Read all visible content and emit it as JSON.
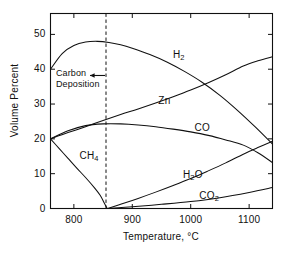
{
  "chart_data": {
    "type": "line",
    "title": "",
    "xlabel": "Temperature, °C",
    "ylabel": "Volume Percent",
    "xlim": [
      760,
      1140
    ],
    "ylim": [
      0,
      56
    ],
    "xticks": [
      800,
      900,
      1000,
      1100
    ],
    "yticks": [
      0,
      10,
      20,
      30,
      40,
      50
    ],
    "grid": false,
    "legend": "inline curve labels",
    "annotations": [
      {
        "text": "Carbon Deposition",
        "line1": "Carbon",
        "line2": "Deposition",
        "arrow": "left-arrow-to-dashed-line",
        "x": 855,
        "y": 38
      }
    ],
    "vertical_reference_line": {
      "x": 855,
      "style": "dashed",
      "label": "carbon deposition boundary"
    },
    "series": [
      {
        "name": "H2",
        "label": "H₂",
        "label_x": 985,
        "label_y": 44,
        "points": [
          [
            760,
            40.0
          ],
          [
            780,
            44.5
          ],
          [
            800,
            46.8
          ],
          [
            820,
            47.8
          ],
          [
            840,
            48.0
          ],
          [
            860,
            47.7
          ],
          [
            880,
            47.0
          ],
          [
            900,
            46.0
          ],
          [
            930,
            44.2
          ],
          [
            960,
            42.0
          ],
          [
            990,
            39.3
          ],
          [
            1020,
            36.2
          ],
          [
            1050,
            32.5
          ],
          [
            1080,
            28.2
          ],
          [
            1110,
            23.5
          ],
          [
            1140,
            18.5
          ]
        ]
      },
      {
        "name": "Zn",
        "label": "Zn",
        "label_x": 960,
        "label_y": 31,
        "points": [
          [
            760,
            20.0
          ],
          [
            790,
            21.8
          ],
          [
            820,
            23.5
          ],
          [
            850,
            25.3
          ],
          [
            880,
            27.0
          ],
          [
            910,
            28.6
          ],
          [
            940,
            30.3
          ],
          [
            970,
            32.1
          ],
          [
            1000,
            34.0
          ],
          [
            1030,
            36.1
          ],
          [
            1060,
            38.4
          ],
          [
            1090,
            40.9
          ],
          [
            1115,
            42.4
          ],
          [
            1140,
            43.6
          ]
        ]
      },
      {
        "name": "CO",
        "label": "CO",
        "label_x": 1022,
        "label_y": 23,
        "points": [
          [
            760,
            20.0
          ],
          [
            790,
            22.3
          ],
          [
            820,
            23.8
          ],
          [
            850,
            24.3
          ],
          [
            880,
            24.3
          ],
          [
            910,
            24.0
          ],
          [
            940,
            23.5
          ],
          [
            970,
            22.8
          ],
          [
            1000,
            22.0
          ],
          [
            1030,
            21.0
          ],
          [
            1060,
            19.7
          ],
          [
            1090,
            18.2
          ],
          [
            1115,
            16.0
          ],
          [
            1140,
            13.2
          ]
        ]
      },
      {
        "name": "CH4",
        "label": "CH₄",
        "label_x": 825,
        "label_y": 15,
        "points": [
          [
            760,
            20.0
          ],
          [
            775,
            17.2
          ],
          [
            790,
            14.4
          ],
          [
            805,
            11.6
          ],
          [
            820,
            8.9
          ],
          [
            835,
            6.0
          ],
          [
            845,
            3.8
          ],
          [
            852,
            1.6
          ],
          [
            856,
            0.3
          ],
          [
            858,
            0.0
          ]
        ]
      },
      {
        "name": "H2O",
        "label": "H₂O",
        "label_x": 1002,
        "label_y": 9.6,
        "points": [
          [
            858,
            0.0
          ],
          [
            880,
            1.2
          ],
          [
            910,
            2.9
          ],
          [
            940,
            4.7
          ],
          [
            970,
            6.6
          ],
          [
            1000,
            8.6
          ],
          [
            1030,
            10.8
          ],
          [
            1060,
            13.1
          ],
          [
            1090,
            15.6
          ],
          [
            1115,
            17.5
          ],
          [
            1140,
            19.3
          ]
        ]
      },
      {
        "name": "CO2",
        "label": "CO₂",
        "label_x": 1030,
        "label_y": 3.5,
        "points": [
          [
            858,
            0.0
          ],
          [
            900,
            0.5
          ],
          [
            950,
            1.2
          ],
          [
            1000,
            2.0
          ],
          [
            1050,
            3.1
          ],
          [
            1100,
            4.6
          ],
          [
            1140,
            6.0
          ]
        ]
      }
    ]
  },
  "axes": {
    "y_tick_labels": [
      "50",
      "40",
      "30",
      "20",
      "10",
      "0"
    ],
    "x_tick_labels": [
      "800",
      "900",
      "1000",
      "1100"
    ],
    "y_axis_title": "Volume Percent",
    "x_axis_title": "Temperature, °C"
  },
  "colors": {
    "line": "#101010",
    "axis": "#101010",
    "background": "#ffffff",
    "dashed": "#101010"
  }
}
